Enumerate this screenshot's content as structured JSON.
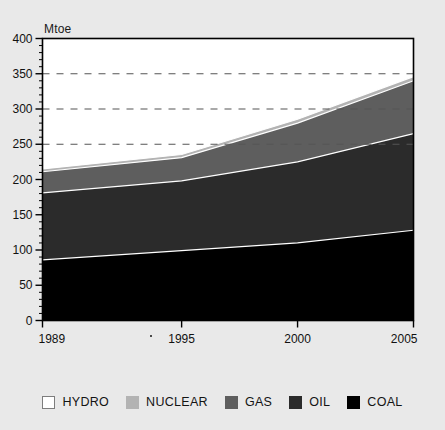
{
  "chart_data": {
    "type": "area",
    "title": "",
    "subtitle": "",
    "xlabel": "",
    "ylabel": "Mtoe",
    "unit_label": "Mtoe",
    "stacked": true,
    "x": [
      1989,
      1995,
      2000,
      2005
    ],
    "xtick_labels": [
      "1989",
      "1995",
      "2000",
      "2005"
    ],
    "xlim": [
      1989,
      2005
    ],
    "ylim": [
      0,
      400
    ],
    "ytick_labels": [
      "0",
      "50",
      "100",
      "150",
      "200",
      "250",
      "300",
      "350",
      "400"
    ],
    "ytick_values": [
      0,
      50,
      100,
      150,
      200,
      250,
      300,
      350,
      400
    ],
    "yminor_step": 10,
    "gridlines": {
      "style": "dashed",
      "color": "#555555",
      "values": [
        250,
        300,
        350
      ]
    },
    "legend_position": "bottom",
    "series": [
      {
        "name": "COAL",
        "color": "#000000",
        "values": [
          86,
          99,
          110,
          128
        ]
      },
      {
        "name": "OIL",
        "color": "#2b2b2b",
        "values": [
          95,
          99,
          115,
          137
        ]
      },
      {
        "name": "GAS",
        "color": "#5e5e5e",
        "values": [
          30,
          33,
          55,
          75
        ]
      },
      {
        "name": "NUCLEAR",
        "color": "#b3b3b3",
        "values": [
          4,
          4.5,
          5.5,
          6
        ]
      },
      {
        "name": "HYDRO",
        "color": "#ffffff",
        "values": [
          3,
          3.5,
          4,
          6
        ]
      }
    ],
    "series_cumulative_tops": [
      {
        "name": "COAL",
        "values": [
          86,
          99,
          110,
          128
        ]
      },
      {
        "name": "OIL",
        "values": [
          181,
          198,
          225,
          265
        ]
      },
      {
        "name": "GAS",
        "values": [
          211,
          231,
          280,
          340
        ]
      },
      {
        "name": "NUCLEAR",
        "values": [
          215,
          235.5,
          285.5,
          346
        ]
      },
      {
        "name": "HYDRO",
        "values": [
          218,
          239,
          289.5,
          352
        ]
      }
    ]
  },
  "legend": {
    "items": [
      {
        "label": "HYDRO",
        "color": "#ffffff"
      },
      {
        "label": "NUCLEAR",
        "color": "#b3b3b3"
      },
      {
        "label": "GAS",
        "color": "#5e5e5e"
      },
      {
        "label": "OIL",
        "color": "#2b2b2b"
      },
      {
        "label": "COAL",
        "color": "#000000"
      }
    ]
  },
  "axis": {
    "unit": "Mtoe"
  }
}
